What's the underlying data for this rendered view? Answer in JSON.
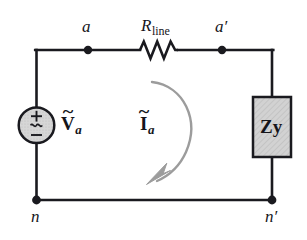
{
  "figure": {
    "type": "electrical-circuit-schematic"
  },
  "colors": {
    "wire": "#1a1a1f",
    "label_text": "#15151a",
    "source_fill": "#d4d4d4",
    "source_stroke": "#1a1a1f",
    "impedance_fill": "#cfcfcf",
    "impedance_stroke": "#1a1a1f",
    "current_arrow": "#9a9a9a",
    "background": "#ffffff"
  },
  "nodes": {
    "a": "a",
    "a_prime": "a′",
    "n": "n",
    "n_prime": "n′"
  },
  "components": {
    "source": {
      "label_main": "V",
      "label_sub": "a",
      "label_accent": "̃",
      "polarity_plus": "+",
      "polarity_minus": "−",
      "waveform": "∿",
      "kind": "ac-voltage-source"
    },
    "resistor": {
      "label_main": "R",
      "label_sub": "line",
      "kind": "line-resistance"
    },
    "impedance": {
      "label_main": "Z",
      "label_sub": "y",
      "label_accent": "",
      "kind": "wye-load-impedance"
    },
    "current": {
      "label_main": "I",
      "label_sub": "a",
      "label_accent": "̃",
      "kind": "loop-current-arrow"
    }
  }
}
